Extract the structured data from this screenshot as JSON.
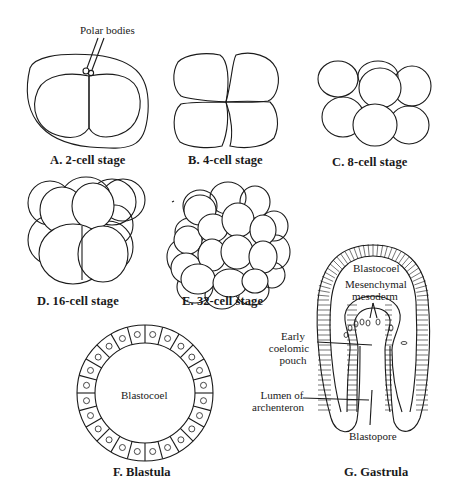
{
  "diagram": {
    "stroke_color": "#1a1a1a",
    "background": "#ffffff",
    "panels": [
      {
        "id": "A",
        "caption": "A. 2-cell stage",
        "labels": [
          "Polar bodies"
        ]
      },
      {
        "id": "B",
        "caption": "B. 4-cell stage",
        "labels": []
      },
      {
        "id": "C",
        "caption": "C. 8-cell stage",
        "labels": []
      },
      {
        "id": "D",
        "caption": "D. 16-cell stage",
        "labels": []
      },
      {
        "id": "E",
        "caption": "E. 32-cell stage",
        "labels": []
      },
      {
        "id": "F",
        "caption": "F. Blastula",
        "labels": [
          "Blastocoel"
        ]
      },
      {
        "id": "G",
        "caption": "G. Gastrula",
        "labels": [
          "Blastocoel",
          "Mesenchymal mesoderm",
          "Early coelomic pouch",
          "Lumen of archenteron",
          "Blastopore"
        ]
      }
    ]
  },
  "labels": {
    "polar_bodies": "Polar bodies",
    "blastula_blastocoel": "Blastocoel",
    "gastrula_blastocoel": "Blastocoel",
    "mesenchymal_1": "Mesenchymal",
    "mesenchymal_2": "mesoderm",
    "coelomic_1": "Early",
    "coelomic_2": "coelomic",
    "coelomic_3": "pouch",
    "lumen_1": "Lumen of",
    "lumen_2": "archenteron",
    "blastopore": "Blastopore"
  },
  "captions": {
    "a": "A. 2-cell stage",
    "b": "B. 4-cell stage",
    "c": "C. 8-cell stage",
    "d": "D. 16-cell stage",
    "e": "E. 32-cell stage",
    "f": "F. Blastula",
    "g": "G. Gastrula"
  }
}
